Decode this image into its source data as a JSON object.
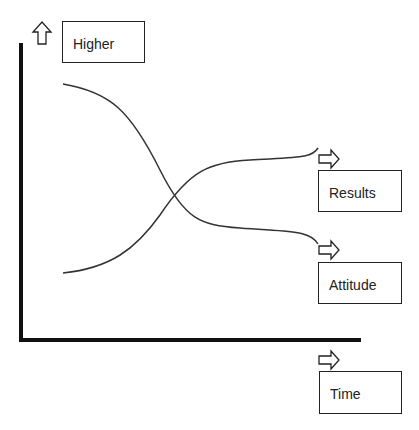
{
  "diagram": {
    "y_axis_label": "Higher",
    "x_axis_label": "Time",
    "curves": [
      {
        "name": "Results",
        "trend": "rising S-curve (low to high)"
      },
      {
        "name": "Attitude",
        "trend": "falling S-curve (high to low)"
      }
    ],
    "labels": {
      "higher": "Higher",
      "results": "Results",
      "attitude": "Attitude",
      "time": "Time"
    },
    "colors": {
      "line": "#333333",
      "axis": "#111111"
    }
  }
}
